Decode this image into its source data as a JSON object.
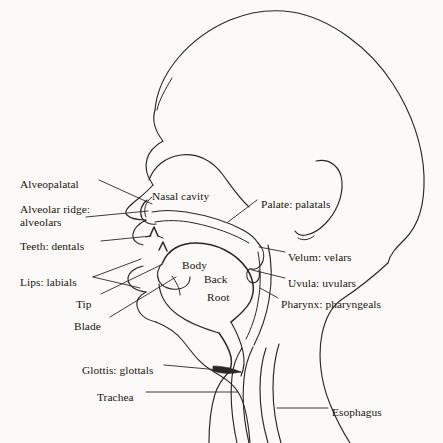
{
  "figure": {
    "type": "midsagittal-vocal-tract-diagram",
    "title": "",
    "background_color": "#fbfaf8",
    "line_color": "#2a2724",
    "text_color": "#17150f"
  },
  "labels_left": [
    {
      "id": "alveopalatal",
      "text": "Alveopalatal",
      "x": 20,
      "y": 178
    },
    {
      "id": "alveolar-ridge",
      "text": "Alveolar ridge:",
      "x": 20,
      "y": 203
    },
    {
      "id": "alveolars",
      "text": "alveolars",
      "x": 20,
      "y": 216
    },
    {
      "id": "teeth-dentals",
      "text": "Teeth: dentals",
      "x": 20,
      "y": 240
    },
    {
      "id": "lips-labials",
      "text": "Lips: labials",
      "x": 20,
      "y": 276
    },
    {
      "id": "tip",
      "text": "Tip",
      "x": 76,
      "y": 298
    },
    {
      "id": "blade",
      "text": "Blade",
      "x": 74,
      "y": 320
    },
    {
      "id": "glottis",
      "text": "Glottis: glottals",
      "x": 82,
      "y": 364
    },
    {
      "id": "trachea",
      "text": "Trachea",
      "x": 97,
      "y": 391
    }
  ],
  "labels_right": [
    {
      "id": "palate-palatals",
      "text": "Palate: palatals",
      "x": 261,
      "y": 198
    },
    {
      "id": "velum-velars",
      "text": "Velum: velars",
      "x": 288,
      "y": 251
    },
    {
      "id": "uvula-uvulars",
      "text": "Uvula: uvulars",
      "x": 288,
      "y": 277
    },
    {
      "id": "pharynx-pharyngeals",
      "text": "Pharynx: pharyngeals",
      "x": 281,
      "y": 298
    },
    {
      "id": "esophagus",
      "text": "Esophagus",
      "x": 332,
      "y": 406
    }
  ],
  "labels_inner": [
    {
      "id": "nasal-cavity",
      "text": "Nasal cavity",
      "x": 152,
      "y": 190
    },
    {
      "id": "body",
      "text": "Body",
      "x": 182,
      "y": 259
    },
    {
      "id": "back",
      "text": "Back",
      "x": 204,
      "y": 273
    },
    {
      "id": "root",
      "text": "Root",
      "x": 207,
      "y": 291
    }
  ]
}
